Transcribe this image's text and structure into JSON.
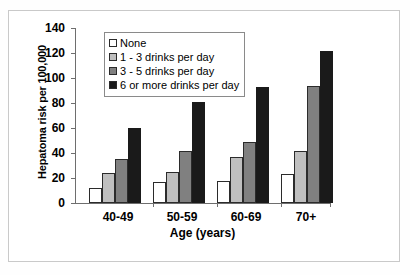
{
  "chart_data": {
    "type": "bar",
    "title": "",
    "xlabel": "Age (years)",
    "ylabel": "Hepatoma risk per 100,000",
    "categories": [
      "40-49",
      "50-59",
      "60-69",
      "70+"
    ],
    "ylim": [
      0,
      140
    ],
    "yticks": [
      0,
      20,
      40,
      60,
      80,
      100,
      120,
      140
    ],
    "grid": false,
    "legend_position": "top-left-inside",
    "series": [
      {
        "name": "None",
        "color": "#ffffff",
        "values": [
          12,
          17,
          18,
          23
        ]
      },
      {
        "name": "1 - 3 drinks per day",
        "color": "#bfbfbf",
        "values": [
          24,
          25,
          37,
          42
        ]
      },
      {
        "name": "3 - 5 drinks per day",
        "color": "#808080",
        "values": [
          35,
          42,
          49,
          94
        ]
      },
      {
        "name": "6 or more drinks per day",
        "color": "#1a1a1a",
        "values": [
          60,
          81,
          93,
          122
        ]
      }
    ]
  },
  "axis": {
    "y_tick_labels": [
      "140",
      "120",
      "100",
      "80",
      "60",
      "40",
      "20",
      "0"
    ],
    "y_title": "Hepatoma risk per 100,000",
    "x_title": "Age (years)",
    "x_tick_labels": [
      "40-49",
      "50-59",
      "60-69",
      "70+"
    ]
  },
  "legend": {
    "items": [
      {
        "label": "None"
      },
      {
        "label": "1 - 3 drinks per day"
      },
      {
        "label": "3 - 5 drinks per day"
      },
      {
        "label": "6 or more drinks per day"
      }
    ]
  }
}
